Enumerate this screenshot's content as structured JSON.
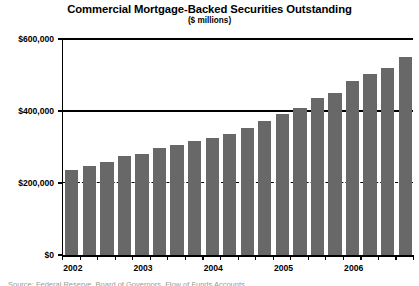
{
  "chart_data": {
    "type": "bar",
    "title": "Commercial Mortgage-Backed Securities Outstanding",
    "subtitle": "($ millions)",
    "xlabel": "",
    "ylabel": "",
    "ylim": [
      0,
      600000
    ],
    "grid": true,
    "legend": null,
    "y_ticks": [
      {
        "value": 0,
        "label": "$0"
      },
      {
        "value": 200000,
        "label": "$200,000"
      },
      {
        "value": 400000,
        "label": "$400,000"
      },
      {
        "value": 600000,
        "label": "$600,000"
      }
    ],
    "x_tick_labels": [
      "2002",
      "2003",
      "2004",
      "2005",
      "2006"
    ],
    "categories": [
      "2002 Q1",
      "2002 Q2",
      "2002 Q3",
      "2002 Q4",
      "2003 Q1",
      "2003 Q2",
      "2003 Q3",
      "2003 Q4",
      "2004 Q1",
      "2004 Q2",
      "2004 Q3",
      "2004 Q4",
      "2005 Q1",
      "2005 Q2",
      "2005 Q3",
      "2005 Q4",
      "2006 Q1",
      "2006 Q2",
      "2006 Q3",
      "2006 Q4"
    ],
    "values": [
      236000,
      247000,
      258000,
      275000,
      280000,
      296000,
      305000,
      316000,
      324000,
      337000,
      352000,
      371000,
      392000,
      407000,
      437000,
      451000,
      484000,
      504000,
      519000,
      549000
    ],
    "bar_color": "#686868",
    "axis_color": "#000000",
    "background_color": "#ffffff"
  },
  "caption": {
    "sliver_text": "Source: Federal Reserve, Board of Governors, Flow of Funds Accounts"
  }
}
